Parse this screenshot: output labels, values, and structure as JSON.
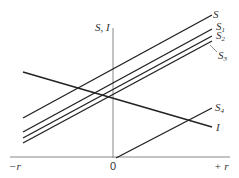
{
  "diagram": {
    "y_axis_label": "S, I",
    "x_axis": {
      "left_label": "−r",
      "origin_label": "0",
      "right_label": "+ r"
    },
    "curves": [
      {
        "name": "S",
        "base": "S",
        "subscript": ""
      },
      {
        "name": "S1",
        "base": "S",
        "subscript": "1"
      },
      {
        "name": "S2",
        "base": "S",
        "subscript": "2"
      },
      {
        "name": "S3",
        "base": "S",
        "subscript": "3"
      },
      {
        "name": "S4",
        "base": "S",
        "subscript": "4"
      },
      {
        "name": "I",
        "base": "I",
        "subscript": ""
      }
    ],
    "colors": {
      "line": "#222222",
      "axis": "#888888",
      "text": "#333333"
    }
  }
}
